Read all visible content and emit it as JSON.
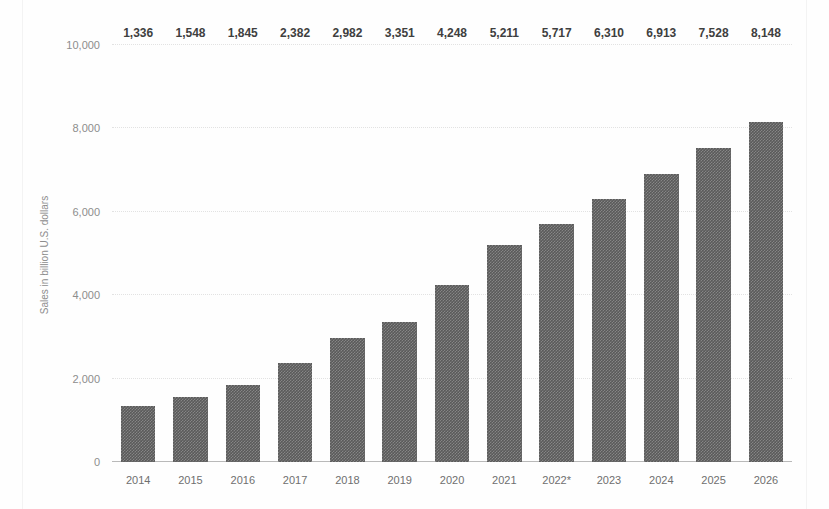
{
  "chart_data": {
    "type": "bar",
    "title": "",
    "xlabel": "",
    "ylabel": "Sales in billion U.S. dollars",
    "categories": [
      "2014",
      "2015",
      "2016",
      "2017",
      "2018",
      "2019",
      "2020",
      "2021",
      "2022*",
      "2023",
      "2024",
      "2025",
      "2026"
    ],
    "values": [
      1336,
      1548,
      1845,
      2382,
      2982,
      3351,
      4248,
      5211,
      5717,
      6310,
      6913,
      7528,
      8148
    ],
    "value_labels": [
      "1,336",
      "1,548",
      "1,845",
      "2,382",
      "2,982",
      "3,351",
      "4,248",
      "5,211",
      "5,717",
      "6,310",
      "6,913",
      "7,528",
      "8,148"
    ],
    "ylim": [
      0,
      10000
    ],
    "yticks": [
      0,
      2000,
      4000,
      6000,
      8000,
      10000
    ],
    "ytick_labels": [
      "0",
      "2,000",
      "4,000",
      "6,000",
      "8,000",
      "10,000"
    ],
    "grid": true,
    "legend": "none",
    "bar_color": "#5a5a5a",
    "grid_color": "#e2e2e2",
    "axis_color": "#b9b9b9",
    "background": "#ffffff",
    "footnote_marker": "*"
  },
  "watermark": {
    "text": ""
  }
}
